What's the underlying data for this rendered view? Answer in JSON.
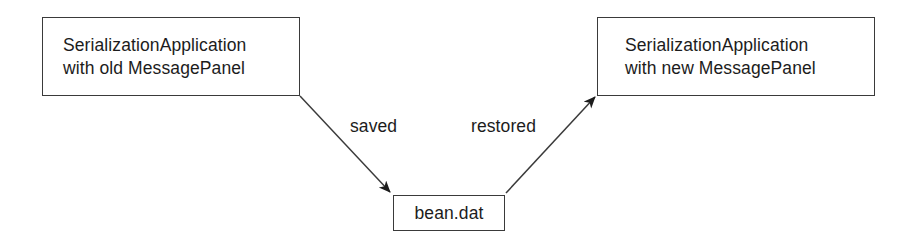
{
  "diagram": {
    "background_color": "#ffffff",
    "stroke_color": "#3a3a3a",
    "text_color": "#1c1c1c",
    "nodes": [
      {
        "id": "source",
        "line1": "SerializationApplication",
        "line2": "with old MessagePanel"
      },
      {
        "id": "target",
        "line1": "SerializationApplication",
        "line2": "with new MessagePanel"
      },
      {
        "id": "file",
        "label": "bean.dat"
      }
    ],
    "edges": [
      {
        "id": "saved",
        "label": "saved",
        "from": "source",
        "to": "file",
        "arrowhead": "at-file"
      },
      {
        "id": "restored",
        "label": "restored",
        "from": "file",
        "to": "target",
        "arrowhead": "at-target"
      }
    ]
  }
}
